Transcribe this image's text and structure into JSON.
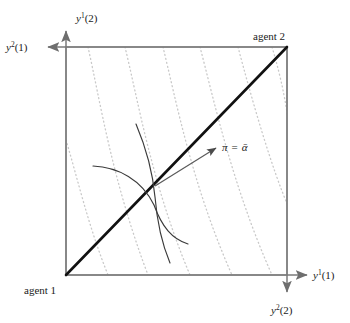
{
  "figure": {
    "type": "edgeworth-box-diagram",
    "background": "#ffffff",
    "box": {
      "x0": 66,
      "y0": 47,
      "x1": 287,
      "y1": 275,
      "stroke": "#8c8c8c",
      "stroke_width": 1.6
    },
    "corners": {
      "agent1_label": "agent 1",
      "agent2_label": "agent 2"
    },
    "axes": [
      {
        "name": "y1-good1-axis",
        "label_base": "y",
        "label_sup": "1",
        "label_arg": "(1)",
        "direction": "right",
        "arrow_from": [
          66,
          275
        ],
        "arrow_to": [
          311,
          275
        ]
      },
      {
        "name": "y1-good2-axis",
        "label_base": "y",
        "label_sup": "1",
        "label_arg": "(2)",
        "direction": "up",
        "arrow_from": [
          66,
          275
        ],
        "arrow_to": [
          66,
          27
        ]
      },
      {
        "name": "y2-good1-axis",
        "label_base": "y",
        "label_sup": "2",
        "label_arg": "(1)",
        "direction": "left",
        "arrow_from": [
          287,
          47
        ],
        "arrow_to": [
          44,
          47
        ]
      },
      {
        "name": "y2-good2-axis",
        "label_base": "y",
        "label_sup": "2",
        "label_arg": "(2)",
        "direction": "down",
        "arrow_from": [
          287,
          47
        ],
        "arrow_to": [
          287,
          296
        ]
      }
    ],
    "diagonal": {
      "name": "contract-diagonal",
      "from": [
        66,
        275
      ],
      "to": [
        287,
        47
      ],
      "stroke": "#000000",
      "stroke_width": 2.6
    },
    "price_arrow": {
      "name": "price-vector-arrow",
      "from": [
        155,
        185
      ],
      "to": [
        219,
        146
      ],
      "stroke": "#555555",
      "label_pi": "π",
      "label_eq": "=",
      "label_alpha": "ᾱ",
      "label_x": 224,
      "label_y": 150
    },
    "dotted_curves": {
      "name": "dotted-price-lines",
      "color": "#c9c9c9",
      "dash": "1 3",
      "count": 7,
      "paths": [
        "M 66,140 C 78,180 88,225 108,275",
        "M 88,47 C 100,100 112,180 148,275",
        "M 125,47 C 138,100 152,185 190,275",
        "M 163,47 C 176,100 192,185 232,275",
        "M 200,47 C 214,100 232,185 272,275",
        "M 238,47 C 252,100 272,170 287,205",
        "M 272,47 C 282,80 287,110 287,128"
      ]
    },
    "indifference_curves": [
      {
        "name": "agent1-indifference-curve",
        "path": "M 93,166 C 120,168 144,182 155,206 C 163,226 172,238 186,243",
        "stroke": "#3a3a3a",
        "stroke_width": 1.2
      },
      {
        "name": "agent2-indifference-curve",
        "path": "M 136,124 C 146,150 153,176 155,198 C 157,222 162,244 169,262",
        "stroke": "#3a3a3a",
        "stroke_width": 1.2
      }
    ],
    "tangency_point": [
      155,
      185
    ]
  },
  "labels": {
    "y1_2": {
      "base": "y",
      "sup": "1",
      "arg": "(2)",
      "x": 76,
      "y": 22
    },
    "y2_1": {
      "base": "y",
      "sup": "2",
      "arg": "(1)",
      "x": 6,
      "y": 51
    },
    "y1_1": {
      "base": "y",
      "sup": "1",
      "arg": "(1)",
      "x": 313,
      "y": 279
    },
    "y2_2": {
      "base": "y",
      "sup": "2",
      "arg": "(2)",
      "x": 271,
      "y": 314
    },
    "agent1": {
      "text": "agent 1",
      "x": 24,
      "y": 294
    },
    "agent2": {
      "text": "agent 2",
      "x": 253,
      "y": 40
    }
  }
}
